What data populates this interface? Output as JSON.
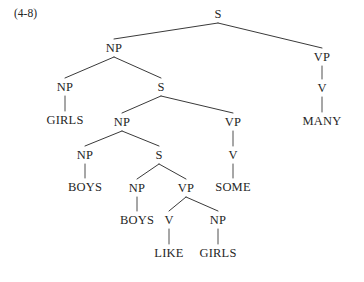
{
  "figure": {
    "label": "(4-8)",
    "caption_position": "top-left",
    "background_color": "#ffffff",
    "text_color": "#262626",
    "edge_color": "#3a3a3a",
    "width": 364,
    "height": 282
  },
  "chart_data": {
    "type": "diagram",
    "diagram_type": "syntax-tree",
    "title": "(4-8)",
    "sentence": "GIRLS BOYS BOYS LIKE GIRLS SOME MANY",
    "nodes": [
      {
        "id": "n0",
        "label": "S",
        "kind": "nonterminal",
        "x": 218,
        "y": 14,
        "depth": 0
      },
      {
        "id": "n1",
        "label": "NP",
        "kind": "nonterminal",
        "x": 114,
        "y": 48,
        "depth": 1
      },
      {
        "id": "n2",
        "label": "VP",
        "kind": "nonterminal",
        "x": 322,
        "y": 57,
        "depth": 1
      },
      {
        "id": "n3",
        "label": "NP",
        "kind": "nonterminal",
        "x": 65,
        "y": 87,
        "depth": 2
      },
      {
        "id": "n4",
        "label": "S",
        "kind": "nonterminal",
        "x": 161,
        "y": 87,
        "depth": 2
      },
      {
        "id": "n5",
        "label": "V",
        "kind": "nonterminal",
        "x": 322,
        "y": 88,
        "depth": 2
      },
      {
        "id": "n6",
        "label": "GIRLS",
        "kind": "terminal",
        "x": 65,
        "y": 120,
        "depth": 3
      },
      {
        "id": "n7",
        "label": "MANY",
        "kind": "terminal",
        "x": 322,
        "y": 121,
        "depth": 3
      },
      {
        "id": "n8",
        "label": "NP",
        "kind": "nonterminal",
        "x": 122,
        "y": 122,
        "depth": 3
      },
      {
        "id": "n9",
        "label": "VP",
        "kind": "nonterminal",
        "x": 233,
        "y": 122,
        "depth": 3
      },
      {
        "id": "n10",
        "label": "NP",
        "kind": "nonterminal",
        "x": 85,
        "y": 155,
        "depth": 4
      },
      {
        "id": "n11",
        "label": "S",
        "kind": "nonterminal",
        "x": 159,
        "y": 155,
        "depth": 4
      },
      {
        "id": "n12",
        "label": "V",
        "kind": "nonterminal",
        "x": 233,
        "y": 155,
        "depth": 4
      },
      {
        "id": "n13",
        "label": "BOYS",
        "kind": "terminal",
        "x": 85,
        "y": 187,
        "depth": 5
      },
      {
        "id": "n14",
        "label": "NP",
        "kind": "nonterminal",
        "x": 137,
        "y": 188,
        "depth": 5
      },
      {
        "id": "n15",
        "label": "VP",
        "kind": "nonterminal",
        "x": 186,
        "y": 188,
        "depth": 5
      },
      {
        "id": "n16",
        "label": "SOME",
        "kind": "terminal",
        "x": 233,
        "y": 187,
        "depth": 5
      },
      {
        "id": "n17",
        "label": "BOYS",
        "kind": "terminal",
        "x": 137,
        "y": 220,
        "depth": 6
      },
      {
        "id": "n18",
        "label": "V",
        "kind": "nonterminal",
        "x": 169,
        "y": 220,
        "depth": 6
      },
      {
        "id": "n19",
        "label": "NP",
        "kind": "nonterminal",
        "x": 218,
        "y": 220,
        "depth": 6
      },
      {
        "id": "n20",
        "label": "LIKE",
        "kind": "terminal",
        "x": 169,
        "y": 253,
        "depth": 7
      },
      {
        "id": "n21",
        "label": "GIRLS",
        "kind": "terminal",
        "x": 218,
        "y": 253,
        "depth": 7
      }
    ],
    "edges": [
      {
        "from": "n0",
        "to": "n1"
      },
      {
        "from": "n0",
        "to": "n2"
      },
      {
        "from": "n1",
        "to": "n3"
      },
      {
        "from": "n1",
        "to": "n4"
      },
      {
        "from": "n2",
        "to": "n5"
      },
      {
        "from": "n3",
        "to": "n6"
      },
      {
        "from": "n5",
        "to": "n7"
      },
      {
        "from": "n4",
        "to": "n8"
      },
      {
        "from": "n4",
        "to": "n9"
      },
      {
        "from": "n8",
        "to": "n10"
      },
      {
        "from": "n8",
        "to": "n11"
      },
      {
        "from": "n9",
        "to": "n12"
      },
      {
        "from": "n10",
        "to": "n13"
      },
      {
        "from": "n11",
        "to": "n14"
      },
      {
        "from": "n11",
        "to": "n15"
      },
      {
        "from": "n12",
        "to": "n16"
      },
      {
        "from": "n14",
        "to": "n17"
      },
      {
        "from": "n15",
        "to": "n18"
      },
      {
        "from": "n15",
        "to": "n19"
      },
      {
        "from": "n18",
        "to": "n20"
      },
      {
        "from": "n19",
        "to": "n21"
      }
    ]
  }
}
